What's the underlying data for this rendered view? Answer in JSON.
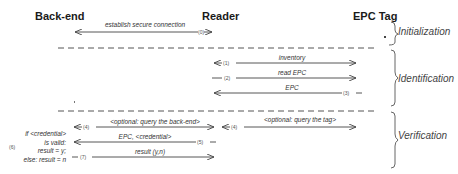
{
  "actors": {
    "backend": "Back-end",
    "reader": "Reader",
    "tag": "EPC Tag"
  },
  "phases": [
    {
      "label": "Initialization"
    },
    {
      "label": "Identification"
    },
    {
      "label": "Verification"
    }
  ],
  "messages": [
    {
      "step": "(0)",
      "label": "establish secure connection",
      "from": "reader",
      "to": "backend",
      "bidirectional": true
    },
    {
      "step": "(1)",
      "label": "inventory",
      "from": "reader",
      "to": "tag",
      "bidirectional": true
    },
    {
      "step": "(2)",
      "label": "read EPC",
      "from": "reader",
      "to": "tag"
    },
    {
      "step": "(3)",
      "label": "EPC",
      "from": "tag",
      "to": "reader"
    },
    {
      "step": "(4)",
      "label": "<optional: query the back-end>",
      "from": "reader",
      "to": "backend",
      "bidirectional": true
    },
    {
      "step": "(4)",
      "label": "<optional: query the tag>",
      "from": "reader",
      "to": "tag",
      "bidirectional": true
    },
    {
      "step": "(5)",
      "label": "EPC, <credential>",
      "from": "reader",
      "to": "backend"
    },
    {
      "step": "(7)",
      "label": "result (y,n)",
      "from": "backend",
      "to": "reader"
    }
  ],
  "backend_note": {
    "step": "(6)",
    "lines": [
      "if <credential>",
      "is valid:",
      "result = y;",
      "else: result = n"
    ]
  },
  "colors": {
    "line": "#444444",
    "text": "#222222",
    "dashed": "#555555"
  }
}
